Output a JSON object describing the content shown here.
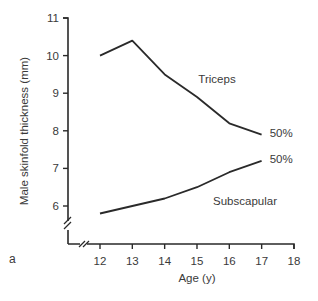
{
  "panel_label": "a",
  "chart_data": {
    "type": "line",
    "title": "",
    "xlabel": "Age (y)",
    "ylabel": "Male skinfold thickness (mm)",
    "x": [
      12,
      13,
      14,
      15,
      16,
      17
    ],
    "xticks": [
      12,
      13,
      14,
      15,
      16,
      17,
      18
    ],
    "yticks": [
      6,
      7,
      8,
      9,
      10,
      11
    ],
    "xlim": [
      11,
      18
    ],
    "ylim": [
      5,
      11
    ],
    "axis_breaks": {
      "x": true,
      "y": true
    },
    "grid": false,
    "legend": "inline labels",
    "series": [
      {
        "name": "Triceps",
        "percentile_label": "50%",
        "values": [
          10.0,
          10.4,
          9.5,
          8.9,
          8.2,
          7.9
        ]
      },
      {
        "name": "Subscapular",
        "percentile_label": "50%",
        "values": [
          5.8,
          6.0,
          6.2,
          6.5,
          6.9,
          7.2
        ]
      }
    ],
    "line_color": "#2a2a2a"
  }
}
